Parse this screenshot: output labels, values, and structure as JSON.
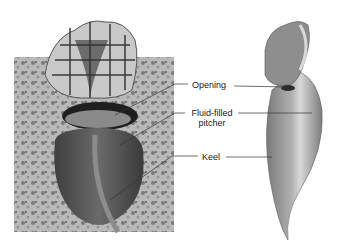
{
  "figure": {
    "panels": [
      {
        "name": "photo",
        "description": "Photograph of pitcher plant with netted hood among foliage"
      },
      {
        "name": "illustration",
        "description": "Drawing of pitcher plant side view"
      }
    ],
    "labels": [
      {
        "id": "opening",
        "text": "Opening"
      },
      {
        "id": "fluid",
        "text": "Fluid-filled pitcher"
      },
      {
        "id": "fluid_line1",
        "text": "Fluid-filled"
      },
      {
        "id": "fluid_line2",
        "text": "pitcher"
      },
      {
        "id": "keel",
        "text": "Keel"
      }
    ]
  }
}
